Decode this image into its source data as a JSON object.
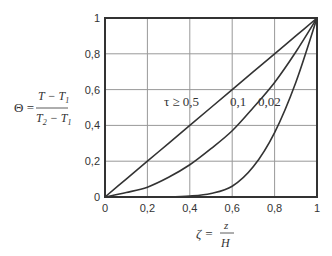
{
  "chart_data": {
    "type": "line",
    "title": "",
    "xlabel": "ζ = z / H",
    "ylabel": "Θ = (T − T1) / (T2 − T1)",
    "xlim": [
      0,
      1
    ],
    "ylim": [
      0,
      1
    ],
    "grid": true,
    "legend": "inline labels on curves",
    "x_ticks": [
      "0",
      "0,2",
      "0,4",
      "0,6",
      "0,8",
      "1"
    ],
    "y_ticks": [
      "0",
      "0,2",
      "0,4",
      "0,6",
      "0,8",
      "1"
    ],
    "x": [
      0,
      0.1,
      0.2,
      0.3,
      0.4,
      0.5,
      0.6,
      0.7,
      0.8,
      0.9,
      1.0
    ],
    "series": [
      {
        "name": "τ ≥ 0,5",
        "values": [
          0,
          0.1,
          0.2,
          0.3,
          0.4,
          0.5,
          0.6,
          0.7,
          0.8,
          0.9,
          1.0
        ]
      },
      {
        "name": "0,1",
        "values": [
          0,
          0.025,
          0.055,
          0.11,
          0.18,
          0.27,
          0.37,
          0.5,
          0.64,
          0.81,
          1.0
        ]
      },
      {
        "name": "0,02",
        "values": [
          0,
          0.0,
          0.0,
          0.0,
          0.005,
          0.02,
          0.06,
          0.17,
          0.36,
          0.64,
          1.0
        ]
      }
    ]
  },
  "labels": {
    "ylabel_lhs": "Θ =",
    "ylabel_num": "T − T",
    "ylabel_num_sub": "1",
    "ylabel_den_a": "T",
    "ylabel_den_a_sub": "2",
    "ylabel_den_b": " − T",
    "ylabel_den_b_sub": "1",
    "xlabel_lhs": "ζ =",
    "xlabel_num": "z",
    "xlabel_den": "H",
    "curve_tau05": "τ ≥ 0,5",
    "curve_tau01": "0,1",
    "curve_tau002": "0,02"
  }
}
